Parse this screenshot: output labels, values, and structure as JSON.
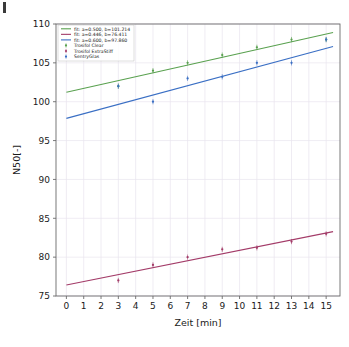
{
  "chart_data": {
    "type": "scatter",
    "title": "",
    "subtitle": "",
    "xlabel": "Zeit [min]",
    "ylabel": "N50[-]",
    "xlim": [
      -0.6,
      15.8
    ],
    "ylim": [
      75,
      110
    ],
    "xticks": [
      0,
      1,
      2,
      3,
      4,
      5,
      6,
      7,
      8,
      9,
      10,
      11,
      12,
      13,
      14,
      15
    ],
    "yticks": [
      75,
      80,
      85,
      90,
      95,
      100,
      105,
      110
    ],
    "grid": true,
    "legend_position": "upper left",
    "x": [
      3,
      5,
      7,
      9,
      11,
      13,
      15
    ],
    "series": [
      {
        "name": "Trosifol Clear",
        "color": "#59a14f",
        "marker": "point",
        "values": [
          102,
          104,
          105,
          106,
          107,
          108,
          108
        ]
      },
      {
        "name": "Trosifol ExtraStiff",
        "color": "#a33b68",
        "marker": "point",
        "values": [
          77,
          79,
          80,
          81,
          81.2,
          82,
          83
        ]
      },
      {
        "name": "SentryGlas",
        "color": "#3a6fc4",
        "marker": "point",
        "values": [
          102,
          100,
          103,
          103.2,
          105,
          105,
          108
        ]
      }
    ],
    "fits": [
      {
        "label": "fit: a=0.500, b=101.214",
        "color": "#59a14f",
        "a": 0.5,
        "b": 101.214
      },
      {
        "label": "fit: a=0.446, b=76.411",
        "color": "#a33b68",
        "a": 0.446,
        "b": 76.411
      },
      {
        "label": "fit: a=0.600, b=97.860",
        "color": "#3a6fc4",
        "a": 0.6,
        "b": 97.86
      }
    ]
  },
  "axis": {
    "x_label": "Zeit [min]",
    "y_label": "N50[-]",
    "x_tick_labels": [
      "0",
      "1",
      "2",
      "3",
      "4",
      "5",
      "6",
      "7",
      "8",
      "9",
      "10",
      "11",
      "12",
      "13",
      "14",
      "15"
    ],
    "y_tick_labels": [
      "75",
      "80",
      "85",
      "90",
      "95",
      "100",
      "105",
      "110"
    ]
  },
  "legend": {
    "entries": [
      {
        "label": "fit: a=0.500, b=101.214",
        "kind": "line",
        "color": "#59a14f"
      },
      {
        "label": "fit: a=0.446, b=76.411",
        "kind": "line",
        "color": "#a33b68"
      },
      {
        "label": "fit: a=0.600, b=97.860",
        "kind": "line",
        "color": "#3a6fc4"
      },
      {
        "label": "Trosifol Clear",
        "kind": "marker",
        "color": "#59a14f"
      },
      {
        "label": "Trosifol ExtraStiff",
        "kind": "marker",
        "color": "#a33b68"
      },
      {
        "label": "SentryGlas",
        "kind": "marker",
        "color": "#3a6fc4"
      }
    ]
  },
  "colors": {
    "green": "#59a14f",
    "purple": "#a33b68",
    "blue": "#3a6fc4",
    "grid": "#e8e4ee",
    "frame": "#6b6b6b",
    "background": "#ffffff"
  }
}
